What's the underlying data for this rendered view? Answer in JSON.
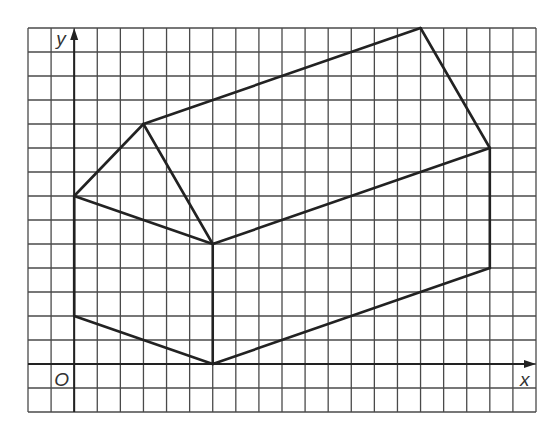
{
  "diagram": {
    "grid": {
      "cols": 22,
      "rows": 16,
      "left": 28,
      "top": 28,
      "right": 536,
      "bottom": 412,
      "origin_col": 2,
      "origin_row": 14,
      "line_color": "#4a4a4a"
    },
    "axes": {
      "x_label": "x",
      "y_label": "y",
      "origin_label": "O",
      "color": "#222222"
    },
    "shape": {
      "color": "#222222",
      "vertices": {
        "A": [
          0,
          2
        ],
        "B": [
          0,
          7
        ],
        "C": [
          3,
          10
        ],
        "D": [
          6,
          5
        ],
        "E": [
          6,
          0
        ],
        "F": [
          18,
          4
        ],
        "G": [
          18,
          9
        ],
        "H": [
          15,
          14
        ]
      },
      "edges": [
        [
          "A",
          "B"
        ],
        [
          "B",
          "C"
        ],
        [
          "C",
          "D"
        ],
        [
          "D",
          "B"
        ],
        [
          "D",
          "E"
        ],
        [
          "E",
          "A"
        ],
        [
          "E",
          "F"
        ],
        [
          "F",
          "G"
        ],
        [
          "G",
          "D"
        ],
        [
          "G",
          "H"
        ],
        [
          "H",
          "C"
        ]
      ]
    }
  }
}
